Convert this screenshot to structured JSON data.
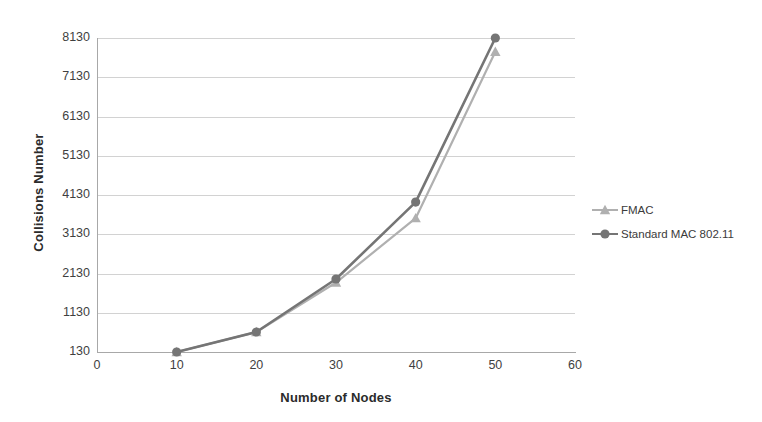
{
  "chart_data": {
    "type": "line",
    "title": "",
    "xlabel": "Number of Nodes",
    "ylabel": "Collisions Number",
    "x": [
      10,
      20,
      30,
      40,
      50
    ],
    "xlim": [
      0,
      60
    ],
    "ylim": [
      130,
      8130
    ],
    "xticks": [
      "0",
      "10",
      "20",
      "30",
      "40",
      "50",
      "60"
    ],
    "yticks": [
      "130",
      "1130",
      "2130",
      "3130",
      "4130",
      "5130",
      "6130",
      "7130",
      "8130"
    ],
    "grid": "horizontal",
    "legend_position": "right",
    "series": [
      {
        "name": "FMAC",
        "color": "#b0b0b0",
        "marker": "triangle",
        "values": [
          130,
          640,
          1900,
          3540,
          7780
        ]
      },
      {
        "name": "Standard MAC 802.11",
        "color": "#757575",
        "marker": "circle",
        "values": [
          130,
          640,
          1990,
          3950,
          8130
        ]
      }
    ]
  },
  "legend": {
    "items": [
      {
        "label": "FMAC"
      },
      {
        "label": "Standard MAC 802.11"
      }
    ]
  },
  "colors": {
    "fmac": "#b0b0b0",
    "standard_mac": "#757575",
    "gridline": "#d2d2d2",
    "axis": "#a8a8a8",
    "text": "#3b3b3b"
  }
}
